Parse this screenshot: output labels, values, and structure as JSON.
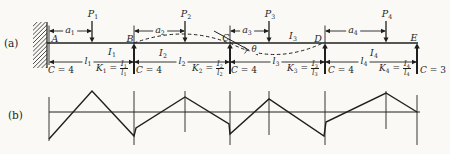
{
  "page": {
    "bg": "#faf9f6",
    "ink": "#1f1f1f"
  },
  "panel_a": {
    "tag": "(a)",
    "beam_y": 43,
    "beam_x0": 47,
    "beam_x1": 418,
    "wall": {
      "x": 33,
      "y": 22,
      "w": 14,
      "h": 46
    },
    "nodes": [
      {
        "label": "A",
        "x": 49,
        "tx": 55,
        "ty": 34
      },
      {
        "label": "B",
        "x": 134,
        "tx": 130,
        "ty": 34
      },
      {
        "label": "C",
        "x": 230,
        "tx": 226,
        "ty": 33
      },
      {
        "label": "D",
        "x": 325,
        "tx": 318,
        "ty": 34
      },
      {
        "label": "E",
        "x": 417,
        "tx": 414,
        "ty": 33
      }
    ],
    "supports": [
      134,
      230,
      325,
      417
    ],
    "loads": [
      {
        "base": "P",
        "sub": "1",
        "x": 92
      },
      {
        "base": "P",
        "sub": "2",
        "x": 185
      },
      {
        "base": "P",
        "sub": "3",
        "x": 269
      },
      {
        "base": "P",
        "sub": "4",
        "x": 386
      }
    ],
    "a_dims": [
      {
        "base": "a",
        "sub": "1",
        "x0": 49,
        "x1": 92,
        "tx": 70
      },
      {
        "base": "a",
        "sub": "2",
        "x0": 134,
        "x1": 185,
        "tx": 160
      },
      {
        "base": "a",
        "sub": "3",
        "x0": 230,
        "x1": 269,
        "tx": 247
      },
      {
        "base": "a",
        "sub": "4",
        "x0": 325,
        "x1": 386,
        "tx": 353
      }
    ],
    "dim_y_a": 31,
    "i_labels": [
      {
        "base": "I",
        "sub": "1",
        "x": 112,
        "ty": 47
      },
      {
        "base": "I",
        "sub": "2",
        "x": 163,
        "ty": 48
      },
      {
        "base": "I",
        "sub": "3",
        "x": 293,
        "ty": 31
      },
      {
        "base": "I",
        "sub": "4",
        "x": 374,
        "ty": 48
      }
    ],
    "l_dims": [
      {
        "base": "l",
        "sub": "1",
        "x0": 49,
        "x1": 134,
        "tx": 88
      },
      {
        "base": "l",
        "sub": "2",
        "x0": 134,
        "x1": 230,
        "tx": 182
      },
      {
        "base": "l",
        "sub": "3",
        "x0": 230,
        "x1": 325,
        "tx": 276
      },
      {
        "base": "l",
        "sub": "4",
        "x0": 325,
        "x1": 417,
        "tx": 364
      }
    ],
    "dim_y_l": 62,
    "theta": {
      "symbol": "θ",
      "x": 254,
      "ty": 45
    },
    "curves": {
      "hump": {
        "x0": 134,
        "cx": 183,
        "cy": 25,
        "x1": 229
      },
      "sag": {
        "x0": 230,
        "cx": 273,
        "cy": 66,
        "x1": 323
      },
      "tangent": {
        "x0": 214,
        "y0": 31,
        "x1": 258,
        "y1": 55
      },
      "arc": {
        "d": "M 244 46.5 Q 248.5 50 244.5 53.5"
      }
    },
    "bottom_row": [
      {
        "type": "plain",
        "x": 48,
        "var": "C",
        "rest": " = 4"
      },
      {
        "type": "frac",
        "x": 96,
        "kbase": "K",
        "ksub": "1",
        "num": "I",
        "numsub": "1",
        "den": "l",
        "densub": "1"
      },
      {
        "type": "plain",
        "x": 136,
        "var": "C",
        "rest": " = 4"
      },
      {
        "type": "frac",
        "x": 192,
        "kbase": "K",
        "ksub": "2",
        "num": "I",
        "numsub": "2",
        "den": "l",
        "densub": "2"
      },
      {
        "type": "plain",
        "x": 231,
        "var": "C",
        "rest": " = 4"
      },
      {
        "type": "frac",
        "x": 287,
        "kbase": "K",
        "ksub": "3",
        "num": "I",
        "numsub": "3",
        "den": "l",
        "densub": "3"
      },
      {
        "type": "plain",
        "x": 328,
        "var": "C",
        "rest": " = 4"
      },
      {
        "type": "frac",
        "x": 379,
        "kbase": "K",
        "ksub": "4",
        "num": "I",
        "numsub": "4",
        "den": "l",
        "densub": "4"
      },
      {
        "type": "plain",
        "x": 420,
        "var": "C",
        "rest": " = 3"
      }
    ]
  },
  "panel_b": {
    "tag": "(b)",
    "axis_y": 112,
    "axis_x0": 49,
    "axis_x1": 420,
    "verticals": [
      {
        "x": 49,
        "y0": 97,
        "y1": 141
      },
      {
        "x": 134,
        "y0": 91,
        "y1": 145
      },
      {
        "x": 185,
        "y0": 91,
        "y1": 132
      },
      {
        "x": 230,
        "y0": 91,
        "y1": 145
      },
      {
        "x": 269,
        "y0": 91,
        "y1": 135
      },
      {
        "x": 325,
        "y0": 91,
        "y1": 145
      },
      {
        "x": 386,
        "y0": 91,
        "y1": 129
      },
      {
        "x": 417,
        "y0": 95,
        "y1": 145
      }
    ],
    "polyline": [
      [
        49,
        139
      ],
      [
        92,
        91
      ],
      [
        134,
        136
      ],
      [
        136,
        128
      ],
      [
        185,
        97
      ],
      [
        229,
        124
      ],
      [
        230,
        134
      ],
      [
        269,
        99
      ],
      [
        324,
        136
      ],
      [
        326,
        122
      ],
      [
        386,
        93
      ],
      [
        417,
        112
      ]
    ]
  }
}
